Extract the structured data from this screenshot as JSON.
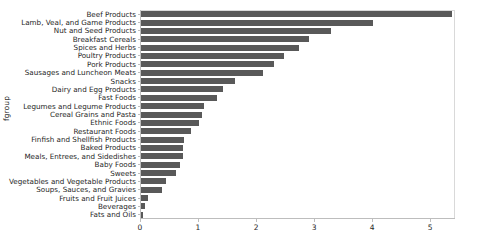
{
  "chart_data": {
    "type": "bar",
    "orientation": "horizontal",
    "title": "",
    "xlabel": "",
    "ylabel": "fgroup",
    "xlim": [
      0,
      5.43
    ],
    "ylim_categories": 22,
    "grid": false,
    "legend": null,
    "bar_color": "#595959",
    "axis_color": "#bdbdbd",
    "text_color": "#262626",
    "xticks": [
      0,
      1,
      2,
      3,
      4,
      5
    ],
    "xtick_labels": [
      "0",
      "1",
      "2",
      "3",
      "4",
      "5"
    ],
    "categories": [
      "Beef Products",
      "Lamb, Veal, and Game Products",
      "Nut and Seed Products",
      "Breakfast Cereals",
      "Spices and Herbs",
      "Poultry Products",
      "Pork Products",
      "Sausages and Luncheon Meats",
      "Snacks",
      "Dairy and Egg Products",
      "Fast Foods",
      "Legumes and Legume Products",
      "Cereal Grains and Pasta",
      "Ethnic Foods",
      "Restaurant Foods",
      "Finfish and Shellfish Products",
      "Baked Products",
      "Meals, Entrees, and Sidedishes",
      "Baby Foods",
      "Sweets",
      "Vegetables and Vegetable Products",
      "Soups, Sauces, and Gravies",
      "Fruits and Fruit Juices",
      "Beverages",
      "Fats and Oils"
    ],
    "values": [
      5.36,
      4.0,
      3.28,
      2.9,
      2.72,
      2.47,
      2.3,
      2.1,
      1.62,
      1.41,
      1.31,
      1.09,
      1.05,
      1.0,
      0.86,
      0.74,
      0.72,
      0.72,
      0.68,
      0.6,
      0.43,
      0.36,
      0.12,
      0.07,
      0.03
    ]
  }
}
